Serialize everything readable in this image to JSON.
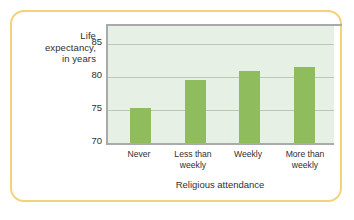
{
  "chart_data": {
    "type": "bar",
    "title": "",
    "subtitle": "",
    "xlabel": "Religious attendance",
    "ylabel": "Life expectancy, in years",
    "ylabel_lines": [
      "Life",
      "expectancy,",
      "in years"
    ],
    "categories": [
      "Never",
      "Less than weekly",
      "Weekly",
      "More than weekly"
    ],
    "category_lines": [
      [
        "Never"
      ],
      [
        "Less than",
        "weekly"
      ],
      [
        "Weekly"
      ],
      [
        "More than",
        "weekly"
      ]
    ],
    "values": [
      75.3,
      79.6,
      81.0,
      81.5
    ],
    "ylim": [
      70,
      87.8
    ],
    "yticks": [
      70,
      75,
      80,
      85
    ],
    "ytick_labels": [
      "70",
      "75",
      "80",
      "85"
    ],
    "gridlines": [
      75,
      80,
      85
    ],
    "grid": true,
    "legend": "none",
    "colors": {
      "bar": "#8fbc5c",
      "plot_background": "#e7f0e4",
      "gridline": "#b9c9b6",
      "axis": "#a9aaac",
      "frame_border": "#f2d37a",
      "text": "#2f2f2f",
      "page_background": "#ffffff"
    }
  }
}
